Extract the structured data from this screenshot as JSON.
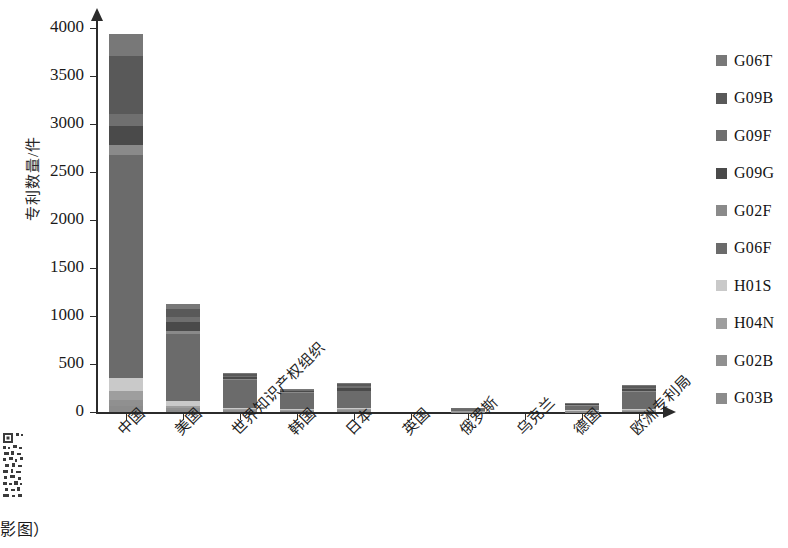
{
  "chart_data": {
    "type": "bar",
    "subtype": "stacked",
    "title": "",
    "xlabel": "",
    "ylabel": "专利数量/件",
    "ylim": [
      0,
      4100
    ],
    "yticks": [
      0,
      500,
      1000,
      1500,
      2000,
      2500,
      3000,
      3500,
      4000
    ],
    "ytick_labels": [
      "0",
      "500",
      "1000",
      "1500",
      "2000",
      "2500",
      "3000",
      "3500",
      "4000"
    ],
    "grid": false,
    "legend_position": "right",
    "categories": [
      "中国",
      "美国",
      "世界知识产权组织",
      "韩国",
      "日本",
      "英国",
      "俄罗斯",
      "乌克兰",
      "德国",
      "欧洲专利局"
    ],
    "series": [
      {
        "name": "G03B",
        "color": "#8c8c8c",
        "values": [
          60,
          18,
          8,
          6,
          8,
          0,
          2,
          0,
          3,
          6
        ]
      },
      {
        "name": "G02B",
        "color": "#909090",
        "values": [
          70,
          22,
          10,
          7,
          9,
          0,
          2,
          0,
          4,
          8
        ]
      },
      {
        "name": "H04N",
        "color": "#9e9e9e",
        "values": [
          90,
          25,
          12,
          8,
          10,
          0,
          3,
          0,
          5,
          9
        ]
      },
      {
        "name": "H01S",
        "color": "#c9c9c9",
        "values": [
          130,
          45,
          14,
          9,
          12,
          0,
          3,
          0,
          6,
          10
        ]
      },
      {
        "name": "G06F",
        "color": "#6b6b6b",
        "values": [
          2320,
          700,
          290,
          170,
          175,
          0,
          20,
          0,
          50,
          175
        ]
      },
      {
        "name": "G02F",
        "color": "#8a8a8a",
        "values": [
          110,
          35,
          12,
          8,
          10,
          0,
          2,
          0,
          5,
          9
        ]
      },
      {
        "name": "G09G",
        "color": "#4a4a4a",
        "values": [
          200,
          90,
          20,
          10,
          28,
          0,
          3,
          0,
          6,
          24
        ]
      },
      {
        "name": "G09F",
        "color": "#6f6f6f",
        "values": [
          120,
          50,
          12,
          8,
          18,
          0,
          2,
          0,
          5,
          14
        ]
      },
      {
        "name": "G09B",
        "color": "#595959",
        "values": [
          610,
          90,
          14,
          8,
          18,
          0,
          2,
          0,
          5,
          14
        ]
      },
      {
        "name": "G06T",
        "color": "#787878",
        "values": [
          220,
          45,
          13,
          8,
          15,
          0,
          2,
          0,
          5,
          12
        ]
      }
    ],
    "totals": [
      3930,
      1120,
      405,
      242,
      303,
      0,
      41,
      0,
      94,
      281
    ]
  },
  "legend": {
    "items": [
      {
        "label": "G06T",
        "color": "#787878",
        "icon": "square-swatch-icon"
      },
      {
        "label": "G09B",
        "color": "#595959",
        "icon": "square-swatch-icon"
      },
      {
        "label": "G09F",
        "color": "#6f6f6f",
        "icon": "square-swatch-icon"
      },
      {
        "label": "G09G",
        "color": "#4a4a4a",
        "icon": "square-swatch-icon"
      },
      {
        "label": "G02F",
        "color": "#8a8a8a",
        "icon": "square-swatch-icon"
      },
      {
        "label": "G06F",
        "color": "#6b6b6b",
        "icon": "square-swatch-icon"
      },
      {
        "label": "H01S",
        "color": "#c9c9c9",
        "icon": "square-swatch-icon"
      },
      {
        "label": "H04N",
        "color": "#9e9e9e",
        "icon": "square-swatch-icon"
      },
      {
        "label": "G02B",
        "color": "#909090",
        "icon": "square-swatch-icon"
      },
      {
        "label": "G03B",
        "color": "#8c8c8c",
        "icon": "square-swatch-icon"
      }
    ]
  },
  "watermark": {
    "qr_icon": "qr-code-icon",
    "caption": "影图）"
  },
  "colors": {
    "axis": "#2b2b2b",
    "text": "#1a1a1a",
    "background": "#ffffff"
  }
}
